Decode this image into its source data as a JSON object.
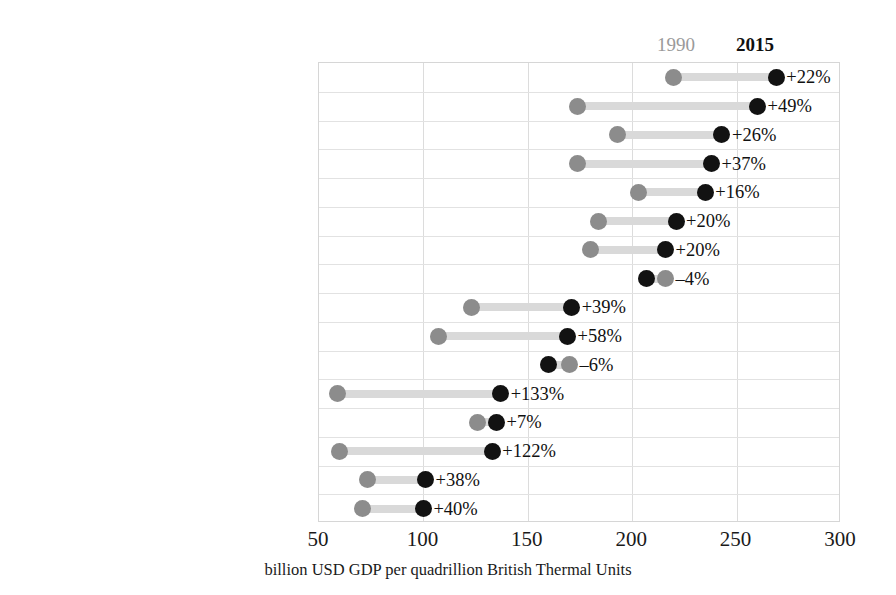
{
  "legend": {
    "old_label": "1990",
    "new_label": "2015",
    "old_color": "#8c8c8c",
    "new_color": "#121212",
    "bar_color": "#d9d9d9"
  },
  "chart_data": {
    "type": "scatter",
    "subtype": "dumbbell",
    "title": "",
    "xlabel": "billion USD GDP per quadrillion British Thermal Units",
    "ylabel": "",
    "xlim": [
      50,
      300
    ],
    "xticks": [
      50,
      100,
      150,
      200,
      250,
      300
    ],
    "xticklabels": [
      "50",
      "100",
      "150",
      "200",
      "250",
      "300"
    ],
    "grid": true,
    "legend_position": "top-right",
    "series": [
      {
        "name": "1990",
        "color": "#8c8c8c"
      },
      {
        "name": "2015",
        "color": "#121212"
      }
    ],
    "categories": [
      "Mexico/Chile",
      "India",
      "Other non-OECD Americas",
      "OECD Europe",
      "Other non-OECD Asia",
      "Africa",
      "Japan",
      "Brazil",
      "Australia/New Zealand",
      "United States",
      "Middle East",
      "China",
      "South Korea",
      "Other non-OECD Europe/Eurasia",
      "Canada",
      "Russia"
    ],
    "rows": [
      {
        "label": "Mexico/Chile",
        "v1990": 220,
        "v2015": 269,
        "change": "+22%"
      },
      {
        "label": "India",
        "v1990": 174,
        "v2015": 260,
        "change": "+49%"
      },
      {
        "label": "Other non-OECD Americas",
        "v1990": 193,
        "v2015": 243,
        "change": "+26%"
      },
      {
        "label": "OECD Europe",
        "v1990": 174,
        "v2015": 238,
        "change": "+37%"
      },
      {
        "label": "Other non-OECD Asia",
        "v1990": 203,
        "v2015": 235,
        "change": "+16%"
      },
      {
        "label": "Africa",
        "v1990": 184,
        "v2015": 221,
        "change": "+20%"
      },
      {
        "label": "Japan",
        "v1990": 180,
        "v2015": 216,
        "change": "+20%"
      },
      {
        "label": "Brazil",
        "v1990": 216,
        "v2015": 207,
        "change": "–4%"
      },
      {
        "label": "Australia/New Zealand",
        "v1990": 123,
        "v2015": 171,
        "change": "+39%"
      },
      {
        "label": "United States",
        "v1990": 107,
        "v2015": 169,
        "change": "+58%"
      },
      {
        "label": "Middle East",
        "v1990": 170,
        "v2015": 160,
        "change": "–6%"
      },
      {
        "label": "China",
        "v1990": 59,
        "v2015": 137,
        "change": "+133%"
      },
      {
        "label": "South Korea",
        "v1990": 126,
        "v2015": 135,
        "change": "+7%"
      },
      {
        "label": "Other non-OECD Europe/Eurasia",
        "v1990": 60,
        "v2015": 133,
        "change": "+122%"
      },
      {
        "label": "Canada",
        "v1990": 73,
        "v2015": 101,
        "change": "+38%"
      },
      {
        "label": "Russia",
        "v1990": 71,
        "v2015": 100,
        "change": "+40%"
      }
    ]
  }
}
